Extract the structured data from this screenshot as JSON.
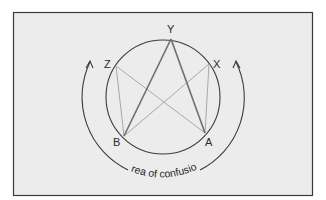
{
  "figure": {
    "background_color": "#ececec",
    "frame_color": "#3a3a3a",
    "circle_color": "#3c3c3c",
    "strong_line_color": "#6e6e6e",
    "faint_line_color": "#a8a8a8",
    "arrow_color": "#3c3c3c"
  },
  "points": {
    "Y": {
      "label": "Y"
    },
    "X": {
      "label": "X"
    },
    "Z": {
      "label": "Z"
    },
    "A": {
      "label": "A"
    },
    "B": {
      "label": "B"
    }
  },
  "lines": [
    {
      "from": "Y",
      "to": "B",
      "style": "strong"
    },
    {
      "from": "Y",
      "to": "A",
      "style": "strong"
    },
    {
      "from": "Z",
      "to": "A",
      "style": "faint"
    },
    {
      "from": "X",
      "to": "B",
      "style": "faint"
    },
    {
      "from": "Z",
      "to": "B",
      "style": "faint"
    },
    {
      "from": "X",
      "to": "A",
      "style": "faint"
    }
  ],
  "caption": "area of confusion"
}
